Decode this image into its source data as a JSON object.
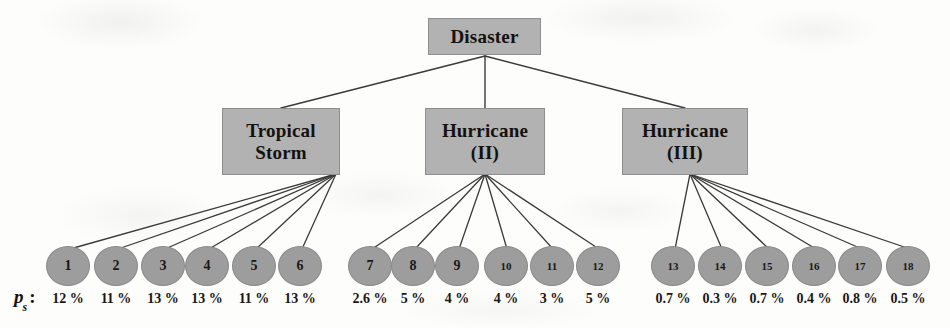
{
  "figure": {
    "type": "hierarchical-tree-diagram",
    "title_text": "",
    "axis_label": {
      "symbol": "p",
      "subscript": "s",
      "colon": ":"
    },
    "colors": {
      "box_fill": "#b2b2b2",
      "box_border": "#8f8f8f",
      "circle_fill": "#9d9d9d",
      "circle_border": "#8a8a8a",
      "edge": "#3a3a3a",
      "text": "#1a1715",
      "background": "#fdfdfc"
    }
  },
  "tree": {
    "root": {
      "id": "root",
      "label": "Disaster"
    },
    "level2": [
      {
        "id": "tropical-storm",
        "label": "Tropical\nStorm"
      },
      {
        "id": "hurricane-2",
        "label": "Hurricane\n(II)"
      },
      {
        "id": "hurricane-3",
        "label": "Hurricane\n(III)"
      }
    ],
    "leaves": [
      {
        "id": "1",
        "label": "1",
        "probability": "12 %",
        "parent": "tropical-storm"
      },
      {
        "id": "2",
        "label": "2",
        "probability": "11 %",
        "parent": "tropical-storm"
      },
      {
        "id": "3",
        "label": "3",
        "probability": "13 %",
        "parent": "tropical-storm"
      },
      {
        "id": "4",
        "label": "4",
        "probability": "13 %",
        "parent": "tropical-storm"
      },
      {
        "id": "5",
        "label": "5",
        "probability": "11 %",
        "parent": "tropical-storm"
      },
      {
        "id": "6",
        "label": "6",
        "probability": "13 %",
        "parent": "tropical-storm"
      },
      {
        "id": "7",
        "label": "7",
        "probability": "2.6 %",
        "parent": "hurricane-2"
      },
      {
        "id": "8",
        "label": "8",
        "probability": "5 %",
        "parent": "hurricane-2"
      },
      {
        "id": "9",
        "label": "9",
        "probability": "4 %",
        "parent": "hurricane-2"
      },
      {
        "id": "10",
        "label": "10",
        "probability": "4 %",
        "parent": "hurricane-2"
      },
      {
        "id": "11",
        "label": "11",
        "probability": "3 %",
        "parent": "hurricane-2"
      },
      {
        "id": "12",
        "label": "12",
        "probability": "5 %",
        "parent": "hurricane-2"
      },
      {
        "id": "13",
        "label": "13",
        "probability": "0.7 %",
        "parent": "hurricane-3"
      },
      {
        "id": "14",
        "label": "14",
        "probability": "0.3 %",
        "parent": "hurricane-3"
      },
      {
        "id": "15",
        "label": "15",
        "probability": "0.7 %",
        "parent": "hurricane-3"
      },
      {
        "id": "16",
        "label": "16",
        "probability": "0.4 %",
        "parent": "hurricane-3"
      },
      {
        "id": "17",
        "label": "17",
        "probability": "0.8 %",
        "parent": "hurricane-3"
      },
      {
        "id": "18",
        "label": "18",
        "probability": "0.5 %",
        "parent": "hurricane-3"
      }
    ]
  },
  "chart_data": {
    "type": "table",
    "xlabel": "Scenario",
    "ylabel": "p_s",
    "categories": [
      "1",
      "2",
      "3",
      "4",
      "5",
      "6",
      "7",
      "8",
      "9",
      "10",
      "11",
      "12",
      "13",
      "14",
      "15",
      "16",
      "17",
      "18"
    ],
    "values": [
      12,
      11,
      13,
      13,
      11,
      13,
      2.6,
      5,
      4,
      4,
      3,
      5,
      0.7,
      0.3,
      0.7,
      0.4,
      0.8,
      0.5
    ],
    "value_labels": [
      "12 %",
      "11 %",
      "13 %",
      "13 %",
      "11 %",
      "13 %",
      "2.6 %",
      "5 %",
      "4 %",
      "4 %",
      "3 %",
      "5 %",
      "0.7 %",
      "0.3 %",
      "0.7 %",
      "0.4 %",
      "0.8 %",
      "0.5 %"
    ],
    "groups": [
      {
        "name": "Tropical Storm",
        "categories": [
          "1",
          "2",
          "3",
          "4",
          "5",
          "6"
        ]
      },
      {
        "name": "Hurricane (II)",
        "categories": [
          "7",
          "8",
          "9",
          "10",
          "11",
          "12"
        ]
      },
      {
        "name": "Hurricane (III)",
        "categories": [
          "13",
          "14",
          "15",
          "16",
          "17",
          "18"
        ]
      }
    ],
    "root": "Disaster"
  },
  "geometry": {
    "leaf_centers_x": [
      68,
      116,
      163,
      207,
      254,
      300,
      370,
      413,
      457,
      506,
      552,
      598,
      673,
      720,
      767,
      814,
      860,
      908
    ],
    "leaf_center_y": 266,
    "fan_origins": {
      "tropical-storm": [
        336,
        174
      ],
      "hurricane-2": [
        485,
        174
      ],
      "hurricane-3": [
        690,
        174
      ]
    },
    "root_origin": [
      485,
      56
    ]
  }
}
